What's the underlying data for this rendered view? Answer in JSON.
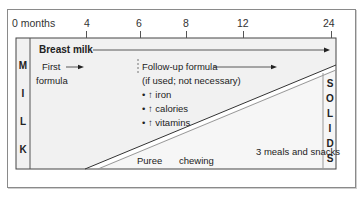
{
  "axis": {
    "ticks": [
      {
        "label": "0 months",
        "x": 12
      },
      {
        "label": "4",
        "x": 84
      },
      {
        "label": "6",
        "x": 139
      },
      {
        "label": "8",
        "x": 186
      },
      {
        "label": "12",
        "x": 241
      },
      {
        "label": "24",
        "x": 328
      }
    ]
  },
  "milk_column": {
    "letters": [
      "M",
      "I",
      "L",
      "K"
    ]
  },
  "solids_column": {
    "letters": [
      "S",
      "O",
      "L",
      "I",
      "D",
      "S"
    ]
  },
  "labels": {
    "breast_milk": "Breast milk",
    "first_formula_line1": "First",
    "first_formula_line2": "formula",
    "followup_line1": "Follow-up formula",
    "followup_line2": "(if used; not necessary)",
    "bullet_iron": "• ↑ iron",
    "bullet_calories": "• ↑ calories",
    "bullet_vitamins": "• ↑ vitamins",
    "meals": "3 meals and snacks",
    "puree": "Puree",
    "chewing": "chewing"
  },
  "colors": {
    "milk_region": "#f0f0f0",
    "solids_region": "#f4f4f4",
    "line": "#333333",
    "border": "#8a8a8a"
  }
}
